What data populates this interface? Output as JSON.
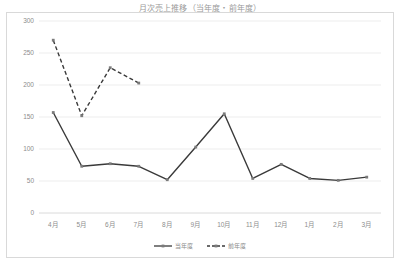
{
  "chart_title": "月次売上推移（当年度・前年度）",
  "legend": {
    "entries": [
      {
        "label": "当年度",
        "style": "solid",
        "color": "#3a3a3a"
      },
      {
        "label": "前年度",
        "style": "dashed",
        "color": "#3a3a3a"
      }
    ]
  },
  "colors": {
    "line": "#3a3a3a",
    "marker": "#7b7b7b",
    "gridline": "#e8e8e8",
    "frame": "#d9d9d9",
    "tick_text": "#8c8c8c",
    "background": "#ffffff"
  },
  "chart_data": {
    "type": "line",
    "title": "月次売上推移（当年度・前年度）",
    "xlabel": "",
    "ylabel": "",
    "categories": [
      "4月",
      "5月",
      "6月",
      "7月",
      "8月",
      "9月",
      "10月",
      "11月",
      "12月",
      "1月",
      "2月",
      "3月"
    ],
    "ylim": [
      0,
      300
    ],
    "yticks": [
      0,
      50,
      100,
      150,
      200,
      250,
      300
    ],
    "grid": true,
    "legend_position": "bottom",
    "series": [
      {
        "name": "当年度",
        "style": "solid",
        "color": "#3a3a3a",
        "values": [
          157,
          73,
          77,
          73,
          52,
          103,
          155,
          54,
          76,
          54,
          51,
          56
        ]
      },
      {
        "name": "前年度",
        "style": "dashed",
        "color": "#3a3a3a",
        "values": [
          270,
          152,
          227,
          203,
          null,
          null,
          null,
          null,
          null,
          null,
          null,
          null
        ]
      }
    ]
  }
}
